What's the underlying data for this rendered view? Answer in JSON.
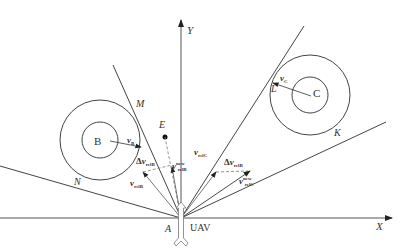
{
  "axes": {
    "x_label": "X",
    "y_label": "Y"
  },
  "points": {
    "origin": "A",
    "uav": "UAV",
    "target": "E",
    "tangent_b_upper": "M",
    "tangent_b_lower": "N",
    "tangent_c_upper": "L",
    "tangent_c_lower": "K"
  },
  "obstacles": [
    {
      "name": "B",
      "velocity_label": "v",
      "velocity_sub": "B"
    },
    {
      "name": "C",
      "velocity_label": "v",
      "velocity_sub": "C"
    }
  ],
  "vectors": {
    "v_relB": {
      "main": "v",
      "sub": "relB"
    },
    "dv_relB": {
      "prefix": "Δ",
      "main": "v",
      "sub": "relB"
    },
    "v_relB_prime": {
      "main": "v",
      "sup": "new",
      "sub": "relB"
    },
    "v_relC": {
      "main": "v",
      "sub": "relC"
    },
    "dv_relC": {
      "prefix": "Δ",
      "main": "v",
      "sub": "relB"
    },
    "v_relC_prime": {
      "main": "v",
      "sup": "new",
      "sub": "relC"
    }
  }
}
